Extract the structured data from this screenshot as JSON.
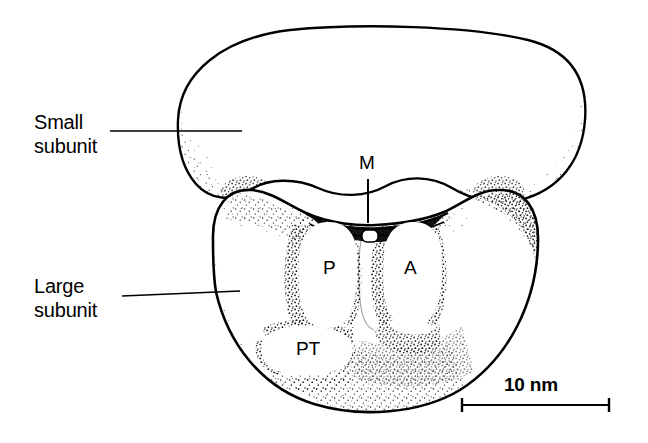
{
  "figure": {
    "background_color": "#ffffff",
    "ink_color": "#000000",
    "width": 648,
    "height": 443
  },
  "labels": {
    "small_subunit": "Small\nsubunit",
    "large_subunit": "Large\nsubunit",
    "m_site": "M",
    "p_site": "P",
    "a_site": "A",
    "pt_site": "PT",
    "scale_bar": "10 nm"
  },
  "scale": {
    "value": "10 nm",
    "length_px": 149,
    "x_start": 461,
    "x_end": 610,
    "y": 405,
    "cap_height": 13
  },
  "leader_lines": [
    {
      "name": "small-subunit-leader",
      "x1": 110,
      "y1": 131,
      "x2": 242,
      "y2": 131
    },
    {
      "name": "large-subunit-leader",
      "x1": 122,
      "y1": 296,
      "x2": 240,
      "y2": 292
    },
    {
      "name": "m-site-leader",
      "x1": 368,
      "y1": 180,
      "x2": 368,
      "y2": 223
    }
  ],
  "structures": [
    {
      "name": "small-subunit-body",
      "shading": "stippled-rim",
      "outline": "solid"
    },
    {
      "name": "large-subunit-body",
      "shading": "stippled-heavy",
      "outline": "solid"
    },
    {
      "name": "p-site-cavity",
      "shading": "stippled-edge",
      "outline": "none"
    },
    {
      "name": "a-site-cavity",
      "shading": "stippled-edge",
      "outline": "none"
    },
    {
      "name": "pt-site-cavity",
      "shading": "stippled-edge",
      "outline": "none"
    },
    {
      "name": "mrna-channel",
      "shading": "solid-dark",
      "outline": "solid"
    }
  ]
}
